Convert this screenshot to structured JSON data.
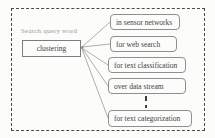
{
  "diagram": {
    "source_label": "Search query word",
    "root_node": "clustering",
    "branches": [
      {
        "label": "in sensor networks"
      },
      {
        "label": "for web search"
      },
      {
        "label": "for text classification"
      },
      {
        "label": "over data stream"
      },
      {
        "label": "for text categorization"
      }
    ],
    "connector_note": "dashed vertical ellipsis between 'over data stream' and 'for text categorization'",
    "colors": {
      "background": "#fcfcfa",
      "boundary_dash": "#4a4a4a",
      "box_border": "#8f8f8f",
      "line": "#9a9a9a",
      "text": "#3f3f3f",
      "label_text": "#9a9a9a"
    }
  }
}
